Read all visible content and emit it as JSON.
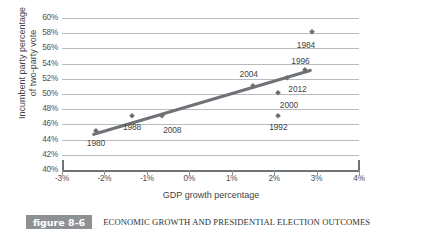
{
  "figure": {
    "number_label": "figure 8-6",
    "caption": "ECONOMIC GROWTH AND PRESIDENTIAL ELECTION OUTCOMES"
  },
  "chart_data": {
    "type": "scatter",
    "title": "ECONOMIC GROWTH AND PRESIDENTIAL ELECTION OUTCOMES",
    "xlabel": "GDP growth percentage",
    "ylabel": "Incumbent party percentage of two-party vote",
    "ylabel_line1": "Incumbent party percentage",
    "ylabel_line2": "of two-party vote",
    "xlim": [
      -3,
      4
    ],
    "ylim": [
      40,
      60
    ],
    "xticks": [
      "-3%",
      "-2%",
      "-1%",
      "0%",
      "1%",
      "2%",
      "3%",
      "4%"
    ],
    "xtick_values": [
      -3,
      -2,
      -1,
      0,
      1,
      2,
      3,
      4
    ],
    "yticks": [
      "40%",
      "42%",
      "44%",
      "46%",
      "48%",
      "50%",
      "52%",
      "54%",
      "56%",
      "58%",
      "60%"
    ],
    "ytick_values": [
      40,
      42,
      44,
      46,
      48,
      50,
      52,
      54,
      56,
      58,
      60
    ],
    "grid": "horizontal",
    "legend": "none",
    "marker_color": "#6b6f73",
    "line_color": "#6f7276",
    "grid_color": "#b9bcbe",
    "points": [
      {
        "label": "1980",
        "x": -2.2,
        "y": 45.1,
        "label_dx": 0,
        "label_dy": -1.5
      },
      {
        "label": "1988",
        "x": -1.35,
        "y": 47.1,
        "label_dx": 0,
        "label_dy": -1.5
      },
      {
        "label": "2008",
        "x": -0.65,
        "y": 47.1,
        "label_dx": 0.25,
        "label_dy": -1.9
      },
      {
        "label": "2004",
        "x": 1.5,
        "y": 51.1,
        "label_dx": -0.1,
        "label_dy": 1.5
      },
      {
        "label": "1992",
        "x": 2.1,
        "y": 47.1,
        "label_dx": 0,
        "label_dy": -1.5
      },
      {
        "label": "2000",
        "x": 2.1,
        "y": 50.1,
        "label_dx": 0.25,
        "label_dy": -1.6
      },
      {
        "label": "2012",
        "x": 2.3,
        "y": 52.1,
        "label_dx": 0.25,
        "label_dy": -1.5
      },
      {
        "label": "1996",
        "x": 2.72,
        "y": 53.1,
        "label_dx": -0.1,
        "label_dy": 1.3
      },
      {
        "label": "1984",
        "x": 2.9,
        "y": 58.1,
        "label_dx": -0.15,
        "label_dy": -1.6
      }
    ],
    "trendline": {
      "x1": -2.25,
      "y1": 44.7,
      "x2": 2.85,
      "y2": 53.1
    }
  }
}
